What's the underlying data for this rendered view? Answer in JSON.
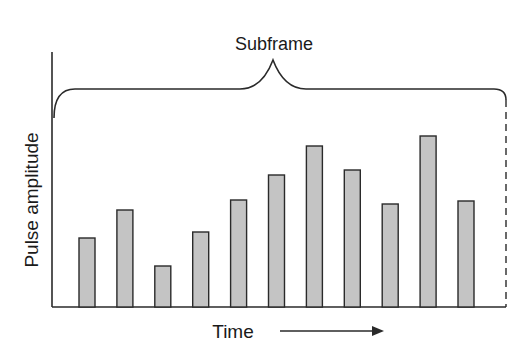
{
  "diagram": {
    "brace_label": "Subframe",
    "y_axis_label": "Pulse amplitude",
    "x_axis_label": "Time",
    "colors": {
      "line": "#2a2a2a",
      "bar_fill": "#c4c4c4",
      "bar_stroke": "#2a2a2a",
      "background": "#ffffff"
    }
  },
  "chart_data": {
    "type": "bar",
    "title": "Subframe",
    "xlabel": "Time",
    "ylabel": "Pulse amplitude",
    "categories": [
      "1",
      "2",
      "3",
      "4",
      "5",
      "6",
      "7",
      "8",
      "9",
      "10",
      "11"
    ],
    "values": [
      69,
      97,
      41,
      75,
      107,
      132,
      161,
      137,
      103,
      171,
      106
    ],
    "units": "relative (pixel height)",
    "grid": false,
    "legend": "none",
    "annotations": [
      "Brace spanning all pulses labeled 'Subframe'",
      "Arrow pointing right next to 'Time'",
      "Dashed vertical line marking subframe end"
    ]
  }
}
